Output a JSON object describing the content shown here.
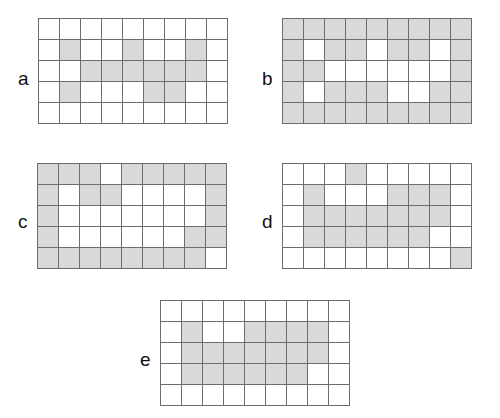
{
  "figure": {
    "type": "grid-matrix-figure",
    "panel_count": 5,
    "grid_columns": 9,
    "grid_rows": 5,
    "cell_size_px": 21,
    "colors": {
      "filled_cell": "#d9d9d9",
      "empty_cell": "#ffffff",
      "grid_line": "#6d6d6d",
      "label_text": "#111111",
      "background": "#ffffff"
    }
  },
  "panels": [
    {
      "label": "a",
      "name": "grid-panel-a",
      "columns": 9,
      "rows": 5,
      "filled_count": 14,
      "cells": [
        [
          0,
          0,
          0,
          0,
          0,
          0,
          0,
          0,
          0
        ],
        [
          0,
          1,
          0,
          0,
          1,
          0,
          0,
          1,
          0
        ],
        [
          0,
          0,
          1,
          1,
          1,
          1,
          1,
          1,
          0
        ],
        [
          0,
          1,
          0,
          0,
          0,
          1,
          1,
          0,
          0
        ],
        [
          0,
          0,
          0,
          0,
          0,
          0,
          0,
          0,
          0
        ]
      ]
    },
    {
      "label": "b",
      "name": "grid-panel-b",
      "columns": 9,
      "rows": 5,
      "filled_count": 32,
      "cells": [
        [
          1,
          1,
          1,
          1,
          1,
          1,
          1,
          1,
          1
        ],
        [
          1,
          0,
          1,
          1,
          0,
          1,
          1,
          0,
          1
        ],
        [
          1,
          1,
          0,
          0,
          0,
          0,
          0,
          0,
          1
        ],
        [
          1,
          0,
          1,
          1,
          1,
          0,
          0,
          1,
          1
        ],
        [
          1,
          1,
          1,
          1,
          1,
          1,
          1,
          1,
          1
        ]
      ]
    },
    {
      "label": "c",
      "name": "grid-panel-c",
      "columns": 9,
      "rows": 5,
      "filled_count": 24,
      "cells": [
        [
          1,
          1,
          1,
          0,
          1,
          1,
          1,
          1,
          1
        ],
        [
          1,
          0,
          1,
          1,
          0,
          0,
          0,
          0,
          1
        ],
        [
          1,
          0,
          0,
          0,
          0,
          0,
          0,
          0,
          1
        ],
        [
          1,
          0,
          0,
          0,
          0,
          0,
          0,
          1,
          1
        ],
        [
          1,
          1,
          1,
          1,
          1,
          1,
          1,
          1,
          0
        ]
      ]
    },
    {
      "label": "d",
      "name": "grid-panel-d",
      "columns": 9,
      "rows": 5,
      "filled_count": 22,
      "cells": [
        [
          0,
          0,
          0,
          1,
          0,
          0,
          0,
          0,
          0
        ],
        [
          0,
          1,
          0,
          0,
          0,
          1,
          1,
          1,
          0
        ],
        [
          0,
          1,
          1,
          1,
          1,
          1,
          1,
          1,
          0
        ],
        [
          0,
          1,
          1,
          1,
          1,
          1,
          1,
          0,
          0
        ],
        [
          0,
          0,
          0,
          0,
          0,
          0,
          0,
          0,
          1
        ]
      ]
    },
    {
      "label": "e",
      "name": "grid-panel-e",
      "columns": 9,
      "rows": 5,
      "filled_count": 20,
      "cells": [
        [
          0,
          0,
          0,
          0,
          0,
          0,
          0,
          0,
          0
        ],
        [
          0,
          1,
          0,
          0,
          1,
          1,
          1,
          1,
          0
        ],
        [
          0,
          1,
          1,
          1,
          1,
          1,
          1,
          1,
          0
        ],
        [
          0,
          1,
          1,
          1,
          1,
          1,
          1,
          0,
          0
        ],
        [
          0,
          0,
          0,
          0,
          0,
          0,
          0,
          0,
          0
        ]
      ]
    }
  ]
}
